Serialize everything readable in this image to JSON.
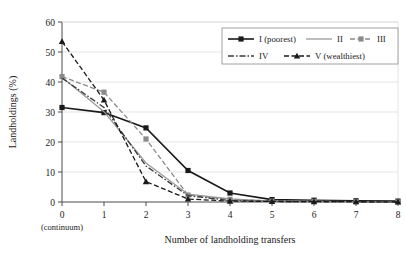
{
  "chart_data": {
    "type": "line",
    "title": "",
    "xlabel": "Number of landholding transfers",
    "ylabel": "Landholdings (%)",
    "x": [
      0,
      1,
      2,
      3,
      4,
      5,
      6,
      7,
      8
    ],
    "xtick_labels": [
      "0",
      "1",
      "2",
      "3",
      "4",
      "5",
      "6",
      "7",
      "8"
    ],
    "x_sublabel": "(continuum)",
    "ytick_labels": [
      "0",
      "10",
      "20",
      "30",
      "40",
      "50",
      "60"
    ],
    "ytick_values": [
      0,
      10,
      20,
      30,
      40,
      50,
      60
    ],
    "xlim": [
      0,
      8
    ],
    "ylim": [
      0,
      60
    ],
    "grid": "horizontal",
    "legend_position": "top-right",
    "series": [
      {
        "name": "I (poorest)",
        "values": [
          31.5,
          29.8,
          24.7,
          10.5,
          3.0,
          0.8,
          0.6,
          0.4,
          0.3
        ],
        "color": "#1a1a1a",
        "marker": "square",
        "dash": "solid"
      },
      {
        "name": "II",
        "values": [
          41.6,
          30.1,
          13.0,
          2.6,
          1.0,
          0.3,
          0.2,
          0.1,
          0.0
        ],
        "color": "#9a9a9a",
        "marker": "none",
        "dash": "solid"
      },
      {
        "name": "III",
        "values": [
          41.8,
          36.6,
          21.0,
          2.3,
          0.9,
          0.3,
          0.2,
          0.1,
          0.0
        ],
        "color": "#8a8a8a",
        "marker": "square",
        "dash": "dashed"
      },
      {
        "name": "IV",
        "values": [
          41.3,
          31.5,
          12.0,
          2.1,
          0.5,
          0.2,
          0.1,
          0.1,
          0.0
        ],
        "color": "#3a3a3a",
        "marker": "none",
        "dash": "dashdot"
      },
      {
        "name": "V (wealthiest)",
        "values": [
          53.5,
          34.0,
          6.8,
          1.0,
          0.3,
          0.2,
          0.1,
          0.1,
          0.0
        ],
        "color": "#1a1a1a",
        "marker": "triangle",
        "dash": "dashed"
      }
    ]
  },
  "legend": {
    "entries": [
      {
        "label": "I (poorest)"
      },
      {
        "label": "II"
      },
      {
        "label": "III"
      },
      {
        "label": "IV"
      },
      {
        "label": "V (wealthiest)"
      }
    ]
  }
}
